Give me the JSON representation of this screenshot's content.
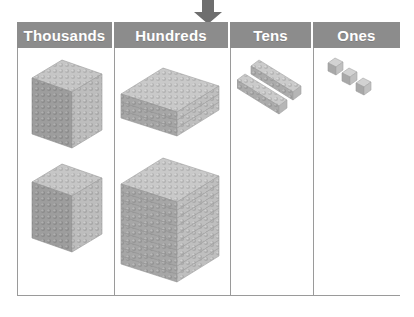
{
  "arrow": {
    "icon": "arrow-down-icon",
    "color": "#6e6e6e",
    "points_to_column": "Hundreds"
  },
  "table": {
    "header_bg": "#8c8c8c",
    "header_text_color": "#ffffff",
    "border_color": "#9a9a9a",
    "body_bg": "#ffffff",
    "block_color": "#b9b9b9",
    "columns": [
      {
        "key": "thousands",
        "label": "Thousands",
        "block_type": "cube",
        "block_name": "thousand-cube",
        "count": 2,
        "value_each": 1000,
        "total": 2000
      },
      {
        "key": "hundreds",
        "label": "Hundreds",
        "block_type": "flat",
        "block_name": "hundred-flat",
        "count": 13,
        "value_each": 100,
        "total": 1300,
        "groups": [
          3,
          10
        ]
      },
      {
        "key": "tens",
        "label": "Tens",
        "block_type": "rod",
        "block_name": "ten-rod",
        "count": 2,
        "value_each": 10,
        "total": 20
      },
      {
        "key": "ones",
        "label": "Ones",
        "block_type": "unit",
        "block_name": "one-unit",
        "count": 3,
        "value_each": 1,
        "total": 3
      }
    ]
  }
}
